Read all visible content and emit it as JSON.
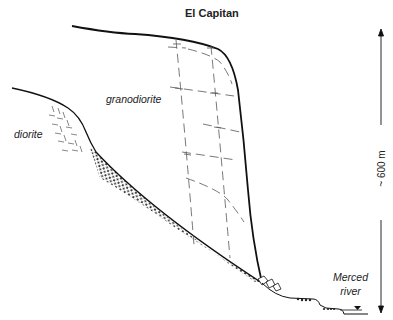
{
  "title": "El Capitan",
  "labels": {
    "granodiorite": "granodiorite",
    "diorite": "diorite",
    "river_line1": "Merced",
    "river_line2": "river",
    "height_scale": "~ 600 m"
  },
  "colors": {
    "line": "#111111",
    "joint": "#555555",
    "dots": "#222222",
    "background": "#ffffff"
  },
  "icons": {
    "water_level": "inverted-triangle",
    "scale_arrow": "vertical-double-arrow"
  }
}
